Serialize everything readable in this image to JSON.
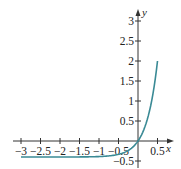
{
  "chart_data": {
    "type": "line",
    "title": "",
    "xlabel": "x",
    "ylabel": "y",
    "xlim": [
      -3,
      0.5
    ],
    "ylim": [
      -0.5,
      3
    ],
    "grid": false,
    "legend": null,
    "x_ticks": [
      "-3",
      "-2.5",
      "-2",
      "-1.5",
      "-1",
      "-0.5",
      "0.5"
    ],
    "y_ticks": [
      "-0.5",
      "0.5",
      "1",
      "1.5",
      "2",
      "2.5",
      "3"
    ],
    "series": [
      {
        "name": "curve",
        "color": "#3a8a95",
        "x": [
          -3,
          -2.5,
          -2,
          -1.5,
          -1,
          -0.5,
          -0.25,
          0,
          0.1,
          0.2,
          0.3,
          0.4,
          0.5
        ],
        "y": [
          -0.4,
          -0.4,
          -0.4,
          -0.4,
          -0.39,
          -0.33,
          -0.24,
          0,
          0.17,
          0.41,
          0.73,
          1.21,
          2.0
        ]
      }
    ]
  },
  "axes": {
    "x_label": "x",
    "y_label": "y",
    "x_tick_labels": [
      "−3",
      "−2.5",
      "−2",
      "−1.5",
      "−1",
      "−0.5",
      "0.5"
    ],
    "y_tick_labels": [
      "−0.5",
      "0.5",
      "1",
      "1.5",
      "2",
      "2.5",
      "3"
    ]
  }
}
